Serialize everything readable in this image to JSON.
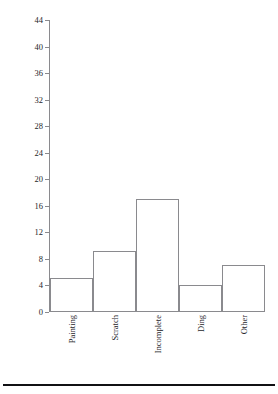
{
  "chart_data": {
    "type": "bar",
    "title": "",
    "subtitle": "",
    "xlabel": "",
    "ylabel": "Number of Defects",
    "categories": [
      "Painting",
      "Scratch",
      "Incomplete",
      "Ding",
      "Other"
    ],
    "values": [
      5,
      9,
      17,
      4,
      7
    ],
    "series": [
      {
        "name": "Number of Defects",
        "values": [
          5,
          9,
          17,
          4,
          7
        ]
      }
    ],
    "ylim": [
      0,
      44
    ],
    "ytick_step": 4,
    "yticks": [
      0,
      4,
      8,
      12,
      16,
      20,
      24,
      28,
      32,
      36,
      40,
      44
    ],
    "ytick_labels": [
      "0",
      "4",
      "8",
      "12",
      "16",
      "20",
      "24",
      "28",
      "32",
      "36",
      "40",
      "44"
    ],
    "grid": false,
    "legend": false,
    "legend_position": "none",
    "bar_fill_color": "#ffffff",
    "bar_edge_color": "#8a8a8e",
    "axis_color": "#8a8a8e",
    "text_color": "#26262a",
    "background_color": "#ffffff",
    "xtick_label_rotation": -90,
    "annotations": []
  },
  "figure": {
    "rule_color": "#111114"
  }
}
